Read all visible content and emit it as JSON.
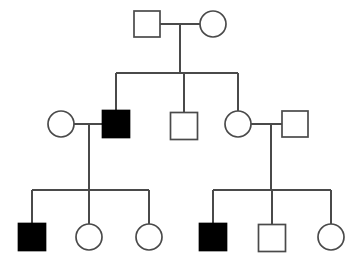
{
  "figure": {
    "kind": "pedigree-chart",
    "title": "",
    "width": 358,
    "height": 263,
    "background_color": "#ffffff",
    "line_color": "#4a4a4a",
    "affected_fill_color": "#000000",
    "unaffected_fill_color": "#ffffff",
    "generations": 3,
    "legend": []
  },
  "chart_data": {
    "type": "diagram",
    "title": "",
    "xlabel": "",
    "ylabel": "",
    "notation": {
      "square": "male",
      "circle": "female",
      "filled": "affected",
      "open": "unaffected"
    },
    "counts": {
      "total_individuals": 12,
      "males": 7,
      "females": 5,
      "affected": 3,
      "unaffected": 9,
      "couples": 3
    },
    "generations": [
      {
        "id": "I",
        "label": "I",
        "center_y": 24,
        "individuals": [
          {
            "id": "I-1",
            "sex": "male",
            "shape": "square",
            "status": "unaffected",
            "filled": false,
            "cx": 147,
            "cy": 24,
            "size": 26
          },
          {
            "id": "I-2",
            "sex": "female",
            "shape": "circle",
            "status": "unaffected",
            "filled": false,
            "cx": 213,
            "cy": 24,
            "size": 26
          }
        ]
      },
      {
        "id": "II",
        "label": "II",
        "center_y": 124,
        "individuals": [
          {
            "id": "II-1",
            "sex": "female",
            "shape": "circle",
            "status": "unaffected",
            "filled": false,
            "cx": 61,
            "cy": 124,
            "size": 26
          },
          {
            "id": "II-2",
            "sex": "male",
            "shape": "square",
            "status": "affected",
            "filled": true,
            "cx": 116,
            "cy": 124,
            "size": 27
          },
          {
            "id": "II-3",
            "sex": "male",
            "shape": "square",
            "status": "unaffected",
            "filled": false,
            "cx": 184,
            "cy": 126,
            "size": 27
          },
          {
            "id": "II-4",
            "sex": "female",
            "shape": "circle",
            "status": "unaffected",
            "filled": false,
            "cx": 238,
            "cy": 124,
            "size": 26
          },
          {
            "id": "II-5",
            "sex": "male",
            "shape": "square",
            "status": "unaffected",
            "filled": false,
            "cx": 295,
            "cy": 124,
            "size": 26
          }
        ]
      },
      {
        "id": "III",
        "label": "III",
        "center_y": 237,
        "individuals": [
          {
            "id": "III-1",
            "sex": "male",
            "shape": "square",
            "status": "affected",
            "filled": true,
            "cx": 32,
            "cy": 237,
            "size": 27
          },
          {
            "id": "III-2",
            "sex": "female",
            "shape": "circle",
            "status": "unaffected",
            "filled": false,
            "cx": 89,
            "cy": 237,
            "size": 26
          },
          {
            "id": "III-3",
            "sex": "female",
            "shape": "circle",
            "status": "unaffected",
            "filled": false,
            "cx": 149,
            "cy": 237,
            "size": 26
          },
          {
            "id": "III-4",
            "sex": "male",
            "shape": "square",
            "status": "affected",
            "filled": true,
            "cx": 213,
            "cy": 237,
            "size": 27
          },
          {
            "id": "III-5",
            "sex": "male",
            "shape": "square",
            "status": "unaffected",
            "filled": false,
            "cx": 272,
            "cy": 238,
            "size": 27
          },
          {
            "id": "III-6",
            "sex": "female",
            "shape": "circle",
            "status": "unaffected",
            "filled": false,
            "cx": 331,
            "cy": 237,
            "size": 26
          }
        ]
      }
    ],
    "matings": [
      {
        "id": "mating-1",
        "partners": [
          "I-1",
          "I-2"
        ],
        "mating_line_y": 24,
        "descent_x": 180,
        "sibship_line_y": 73,
        "children": [
          "II-2",
          "II-3",
          "II-4"
        ]
      },
      {
        "id": "mating-2",
        "partners": [
          "II-1",
          "II-2"
        ],
        "mating_line_y": 124,
        "descent_x": 89,
        "sibship_line_y": 190,
        "children": [
          "III-1",
          "III-2",
          "III-3"
        ]
      },
      {
        "id": "mating-3",
        "partners": [
          "II-4",
          "II-5"
        ],
        "mating_line_y": 124,
        "descent_x": 271,
        "sibship_line_y": 190,
        "children": [
          "III-4",
          "III-5",
          "III-6"
        ]
      }
    ]
  }
}
